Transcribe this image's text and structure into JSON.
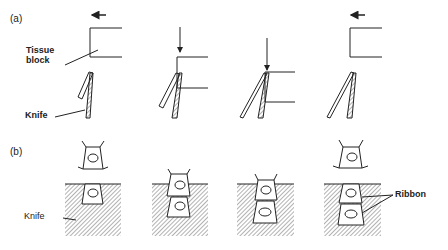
{
  "panel_a": {
    "label": "(a)",
    "tissue_block_label_line1": "Tissue",
    "tissue_block_label_line2": "block",
    "knife_label": "Knife"
  },
  "panel_b": {
    "label": "(b)",
    "knife_label": "Knife",
    "ribbon_label": "Ribbon"
  },
  "colors": {
    "line": "#222222",
    "hatch": "#555555"
  }
}
